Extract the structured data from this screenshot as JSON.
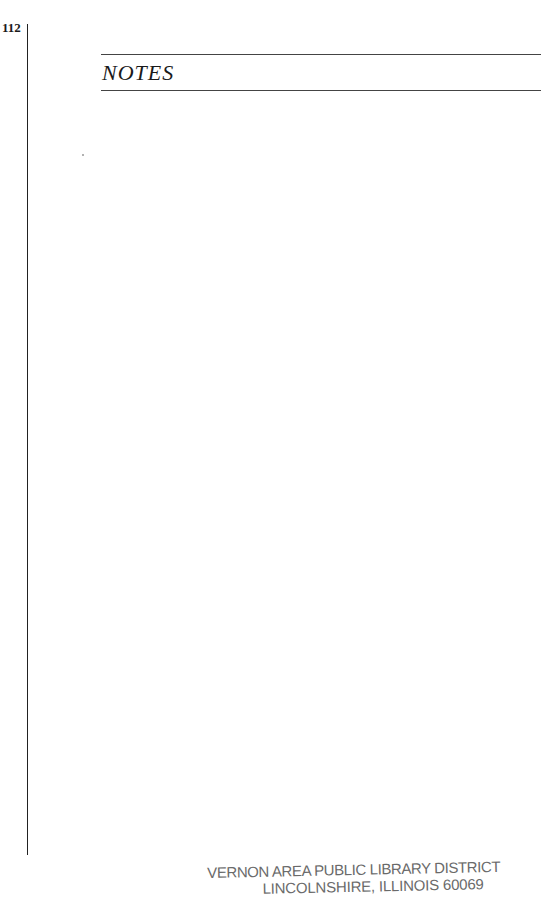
{
  "page": {
    "number": "112",
    "section_title": "NOTES"
  },
  "stamp": {
    "line1": "VERNON AREA PUBLIC LIBRARY DISTRICT",
    "line2": "LINCOLNSHIRE, ILLINOIS 60069"
  }
}
